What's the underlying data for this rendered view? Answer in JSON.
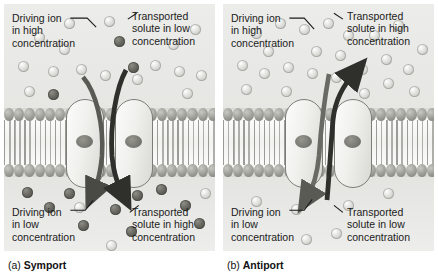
{
  "figure": {
    "background_color": "#ffffff",
    "panel_background": "#e9e9e6"
  },
  "legend_colors": {
    "driving_ion": "#d9d9d4",
    "transported_solute": "#5e5e58",
    "membrane_head": "#9d9d97",
    "protein_outline": "#7d7d78",
    "arrow": "#3a3a36"
  },
  "panels": [
    {
      "id": "symport",
      "caption_tag": "(a)",
      "caption_name": "Symport",
      "labels": {
        "top_left": [
          "Driving ion",
          "in high",
          "concentration"
        ],
        "top_right": [
          "Transported",
          "solute in low",
          "concentration"
        ],
        "bottom_left": [
          "Driving ion",
          "in low",
          "concentration"
        ],
        "bottom_right": [
          "Transported",
          "solute in high",
          "concentration"
        ]
      },
      "arrows": [
        {
          "name": "driving-ion-arrow",
          "direction": "inward-down"
        },
        {
          "name": "transported-solute-arrow",
          "direction": "inward-down"
        }
      ]
    },
    {
      "id": "antiport",
      "caption_tag": "(b)",
      "caption_name": "Antiport",
      "labels": {
        "top_left": [
          "Driving ion",
          "in high",
          "concentration"
        ],
        "top_right": [
          "Transported",
          "solute in high",
          "concentration"
        ],
        "bottom_left": [
          "Driving ion",
          "in low",
          "concentration"
        ],
        "bottom_right": [
          "Transported",
          "solute in low",
          "concentration"
        ]
      },
      "arrows": [
        {
          "name": "driving-ion-arrow",
          "direction": "inward-down"
        },
        {
          "name": "transported-solute-arrow",
          "direction": "outward-up"
        }
      ]
    }
  ]
}
